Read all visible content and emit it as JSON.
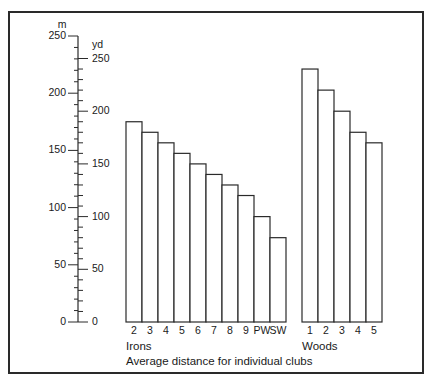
{
  "chart_data": {
    "type": "bar",
    "title": "",
    "caption": "Average distance for individual clubs",
    "xlabel": "",
    "ylabel_left": "m",
    "ylabel_right": "yd",
    "ylim_yd": [
      0,
      250
    ],
    "ylim_m": [
      0,
      250
    ],
    "meter_ticks": [
      0,
      50,
      100,
      150,
      200,
      250
    ],
    "yard_ticks": [
      0,
      50,
      100,
      150,
      200,
      250
    ],
    "groups": [
      {
        "name": "Irons",
        "categories": [
          "2",
          "3",
          "4",
          "5",
          "6",
          "7",
          "8",
          "9",
          "PW",
          "SW"
        ],
        "values_yd": [
          190,
          180,
          170,
          160,
          150,
          140,
          130,
          120,
          100,
          80
        ]
      },
      {
        "name": "Woods",
        "categories": [
          "1",
          "2",
          "3",
          "4",
          "5"
        ],
        "values_yd": [
          240,
          220,
          200,
          180,
          170
        ]
      }
    ],
    "categories": [
      "2",
      "3",
      "4",
      "5",
      "6",
      "7",
      "8",
      "9",
      "PW",
      "SW",
      "1",
      "2",
      "3",
      "4",
      "5"
    ],
    "series": [
      {
        "name": "Average distance (yd)",
        "values": [
          190,
          180,
          170,
          160,
          150,
          140,
          130,
          120,
          100,
          80,
          240,
          220,
          200,
          180,
          170
        ]
      }
    ],
    "grid": false,
    "legend": "none"
  },
  "axis": {
    "m_unit": "m",
    "yd_unit": "yd",
    "m_labels": [
      "0",
      "50",
      "100",
      "150",
      "200",
      "250"
    ],
    "yd_labels": [
      "0",
      "50",
      "100",
      "150",
      "200",
      "250"
    ]
  },
  "labels": {
    "irons_group": "Irons",
    "woods_group": "Woods",
    "caption": "Average distance for individual clubs"
  },
  "colors": {
    "stroke": "#2a2a2a",
    "bar_fill": "#ffffff",
    "text": "#1a1a1a"
  }
}
